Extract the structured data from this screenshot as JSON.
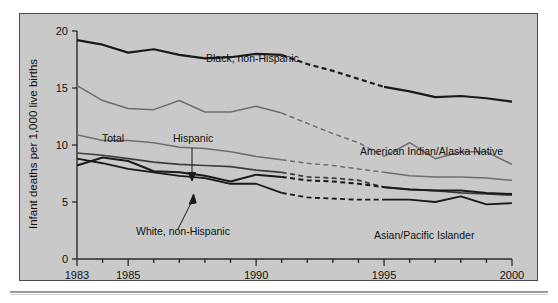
{
  "figure": {
    "background_color": "#c9c9c9",
    "frame_color": "#4a4a4a"
  },
  "chart_data": {
    "type": "line",
    "title": "",
    "xlabel": "",
    "ylabel": "Infant deaths per 1,000 live births",
    "xlim": [
      1983,
      2000
    ],
    "ylim": [
      0,
      20
    ],
    "yticks": [
      0,
      5,
      10,
      15,
      20
    ],
    "ytick_labels": [
      "0",
      "5",
      "10",
      "15",
      "20"
    ],
    "xticks": [
      1983,
      1984,
      1985,
      1986,
      1987,
      1988,
      1989,
      1990,
      1991,
      1992,
      1993,
      1994,
      1995,
      1996,
      1997,
      1998,
      1999,
      2000
    ],
    "xtick_labels_shown": [
      "1983",
      "1985",
      "1990",
      "1995",
      "2000"
    ],
    "grid": false,
    "legend": "inline-annotations",
    "dashed_segment_years": [
      1991,
      1995
    ],
    "dashed_note": "Series are dashed between 1991 and 1995",
    "x": [
      1983,
      1984,
      1985,
      1986,
      1987,
      1988,
      1989,
      1990,
      1991,
      1992,
      1993,
      1994,
      1995,
      1996,
      1997,
      1998,
      1999,
      2000
    ],
    "series": [
      {
        "name": "Black, non-Hispanic",
        "color": "#1a1a1a",
        "width": 2.2,
        "values": [
          19.2,
          18.8,
          18.1,
          18.4,
          17.9,
          17.6,
          17.7,
          18.0,
          17.9,
          17.1,
          16.5,
          15.8,
          15.1,
          14.7,
          14.2,
          14.3,
          14.1,
          13.8
        ]
      },
      {
        "name": "American Indian/Alaska Native",
        "color": "#6e6e6e",
        "width": 1.5,
        "values": [
          15.2,
          13.9,
          13.2,
          13.1,
          13.9,
          12.9,
          12.9,
          13.4,
          12.8,
          11.9,
          11.0,
          10.2,
          9.0,
          10.2,
          8.8,
          9.4,
          9.4,
          8.3
        ]
      },
      {
        "name": "Total",
        "color": "#6e6e6e",
        "width": 1.5,
        "values": [
          10.9,
          10.4,
          10.4,
          10.2,
          9.8,
          9.7,
          9.4,
          9.0,
          8.7,
          8.4,
          8.2,
          7.9,
          7.6,
          7.3,
          7.2,
          7.2,
          7.1,
          6.9
        ]
      },
      {
        "name": "Hispanic",
        "color": "#3d3d3d",
        "width": 1.7,
        "values": [
          9.3,
          9.1,
          8.8,
          8.5,
          8.3,
          8.2,
          8.1,
          7.8,
          7.6,
          7.2,
          7.1,
          6.9,
          6.3,
          6.1,
          6.0,
          5.8,
          5.7,
          5.6
        ]
      },
      {
        "name": "White, non-Hispanic",
        "color": "#1a1a1a",
        "width": 2.0,
        "values": [
          8.2,
          8.9,
          8.6,
          7.7,
          7.6,
          7.3,
          6.8,
          7.4,
          7.2,
          6.9,
          6.8,
          6.6,
          6.3,
          6.1,
          6.0,
          6.0,
          5.8,
          5.7
        ]
      },
      {
        "name": "Asian/Pacific Islander",
        "color": "#1a1a1a",
        "width": 1.8,
        "values": [
          8.8,
          8.4,
          7.9,
          7.6,
          7.3,
          7.1,
          6.6,
          6.6,
          5.8,
          5.4,
          5.3,
          5.2,
          5.2,
          5.2,
          5.0,
          5.5,
          4.8,
          4.9
        ]
      }
    ],
    "annotations": [
      {
        "text": "Black, non-Hispanic",
        "x_px": 186,
        "y_px": 48
      },
      {
        "text": "American Indian/Alaska Native",
        "x_px": 340,
        "y_px": 141
      },
      {
        "text": "Total",
        "x_px": 82,
        "y_px": 128
      },
      {
        "text": "Hispanic",
        "x_px": 153,
        "y_px": 128
      },
      {
        "text": "White, non-Hispanic",
        "x_px": 116,
        "y_px": 221
      },
      {
        "text": "Asian/Pacific Islander",
        "x_px": 354,
        "y_px": 225
      }
    ]
  }
}
